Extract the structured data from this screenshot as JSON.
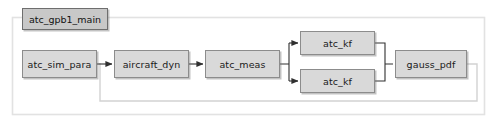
{
  "diagram": {
    "title": "atc_gpb1_main",
    "colors": {
      "block_fill": "#d9d9d9",
      "block_border": "#8c8c8c",
      "title_fill": "#c8c8c8",
      "title_border": "#6e6e6e",
      "wire": "#404040",
      "panel_border": "#e2e2e2",
      "feedback_wire": "#d2d2d2",
      "background": "#ffffff"
    },
    "blocks": [
      {
        "id": "atc_sim_para",
        "label": "atc_sim_para",
        "x": 22,
        "y": 50,
        "w": 75,
        "h": 28
      },
      {
        "id": "aircraft_dyn",
        "label": "aircraft_dyn",
        "x": 114,
        "y": 50,
        "w": 75,
        "h": 28
      },
      {
        "id": "atc_meas",
        "label": "atc_meas",
        "x": 205,
        "y": 50,
        "w": 75,
        "h": 28
      },
      {
        "id": "atc_kf_top",
        "label": "atc_kf",
        "x": 300,
        "y": 31,
        "w": 75,
        "h": 24
      },
      {
        "id": "atc_kf_bottom",
        "label": "atc_kf",
        "x": 300,
        "y": 69,
        "w": 75,
        "h": 24
      },
      {
        "id": "gauss_pdf",
        "label": "gauss_pdf",
        "x": 395,
        "y": 50,
        "w": 72,
        "h": 28
      }
    ],
    "connections": [
      {
        "from": "atc_sim_para",
        "to": "aircraft_dyn",
        "kind": "arrow"
      },
      {
        "from": "aircraft_dyn",
        "to": "atc_meas",
        "kind": "arrow"
      },
      {
        "from": "atc_meas",
        "to": "atc_kf_top",
        "kind": "branch-arrow"
      },
      {
        "from": "atc_meas",
        "to": "atc_kf_bottom",
        "kind": "branch-arrow"
      },
      {
        "from": "atc_kf_top",
        "to": "gauss_pdf",
        "kind": "merge"
      },
      {
        "from": "atc_kf_bottom",
        "to": "gauss_pdf",
        "kind": "merge"
      },
      {
        "from": "gauss_pdf",
        "to": "aircraft_dyn",
        "kind": "feedback"
      }
    ]
  }
}
